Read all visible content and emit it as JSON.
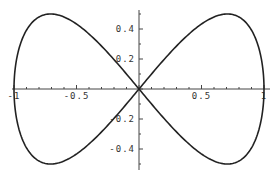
{
  "chart_data": {
    "type": "line",
    "title": "",
    "xlabel": "",
    "ylabel": "",
    "xlim": [
      -1.0,
      1.0
    ],
    "ylim": [
      -0.53,
      0.53
    ],
    "grid": false,
    "legend": null,
    "x_ticks": [
      {
        "value": -1,
        "label": "-1"
      },
      {
        "value": -0.5,
        "label": "-0.5"
      },
      {
        "value": 0.5,
        "label": "0.5"
      },
      {
        "value": 1,
        "label": "1"
      }
    ],
    "y_ticks": [
      {
        "value": 0.4,
        "label": "0.4"
      },
      {
        "value": 0.2,
        "label": "0.2"
      },
      {
        "value": -0.2,
        "label": "-0.2"
      },
      {
        "value": -0.4,
        "label": "-0.4"
      }
    ],
    "series": [
      {
        "name": "curve",
        "color": "#222222",
        "x": [
          0,
          0.259,
          0.5,
          0.707,
          0.866,
          0.966,
          1.0,
          0.966,
          0.866,
          0.707,
          0.5,
          0.259,
          0,
          -0.259,
          -0.5,
          -0.707,
          -0.866,
          -0.966,
          -1.0,
          -0.966,
          -0.866,
          -0.707,
          -0.5,
          -0.259,
          0
        ],
        "y": [
          0,
          0.25,
          0.433,
          0.5,
          0.433,
          0.25,
          0,
          -0.25,
          -0.433,
          -0.5,
          -0.433,
          -0.25,
          0,
          0.25,
          0.433,
          0.5,
          0.433,
          0.25,
          0,
          -0.25,
          -0.433,
          -0.5,
          -0.433,
          -0.25,
          0
        ]
      }
    ]
  }
}
